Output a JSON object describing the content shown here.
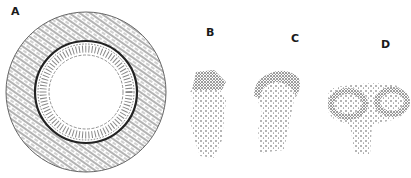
{
  "figure": {
    "panels": [
      {
        "label": "A",
        "description": "cross-section with outer fibrous layer, dark band, columnar epithelium and open lumen"
      },
      {
        "label": "B",
        "description": "elongated stippled structure with fringed top"
      },
      {
        "label": "C",
        "description": "stippled structure with curved cap"
      },
      {
        "label": "D",
        "description": "stippled structure with two lateral lobes"
      }
    ]
  },
  "colors": {
    "ink": "#1a1a1a",
    "background": "#ffffff"
  }
}
